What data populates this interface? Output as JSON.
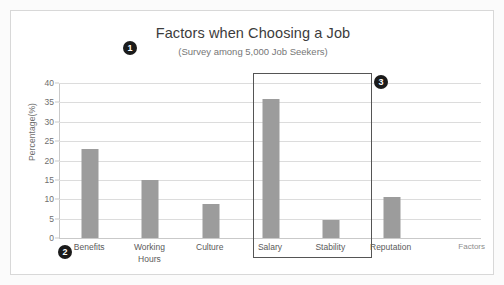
{
  "chart_data": {
    "type": "bar",
    "title": "Factors when Choosing a Job",
    "subtitle": "(Survey among 5,000 Job Seekers)",
    "xlabel": "Factors",
    "ylabel": "Percentage(%)",
    "ylim": [
      0,
      40
    ],
    "ytick_step": 5,
    "yticks": [
      "40",
      "35",
      "30",
      "25",
      "20",
      "15",
      "10",
      "5",
      "0"
    ],
    "grid": true,
    "legend": "none",
    "bar_color": "#9c9c9c",
    "categories": [
      "Benefits",
      "Working Hours",
      "Culture",
      "Salary",
      "Stability",
      "Reputation"
    ],
    "values": [
      23,
      15,
      8.8,
      36,
      4.7,
      10.5
    ],
    "points": [
      {
        "label": "Benefits",
        "label_lines": [
          "Benefits"
        ],
        "value": 23
      },
      {
        "label": "Working Hours",
        "label_lines": [
          "Working",
          "Hours"
        ],
        "value": 15
      },
      {
        "label": "Culture",
        "label_lines": [
          "Culture"
        ],
        "value": 8.8
      },
      {
        "label": "Salary",
        "label_lines": [
          "Salary"
        ],
        "value": 36
      },
      {
        "label": "Stability",
        "label_lines": [
          "Stability"
        ],
        "value": 4.7
      },
      {
        "label": "Reputation",
        "label_lines": [
          "Reputation"
        ],
        "value": 10.5
      }
    ],
    "annotations": [
      {
        "id": "1",
        "target": "chart-title"
      },
      {
        "id": "2",
        "target": "x-axis-start"
      },
      {
        "id": "3",
        "target": "highlight-region"
      }
    ],
    "highlight_region": {
      "categories": [
        "Salary",
        "Stability"
      ],
      "border_color": "#555555"
    }
  }
}
